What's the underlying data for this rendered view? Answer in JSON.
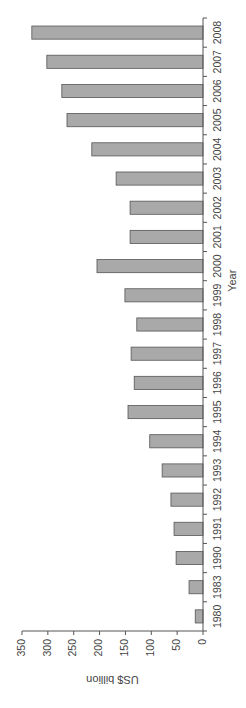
{
  "chart_data": {
    "type": "bar",
    "orientation": "rotated-90-clockwise",
    "title": "",
    "xlabel": "Year",
    "ylabel": "US$ billion",
    "ylim": [
      0,
      350
    ],
    "yticks": [
      0,
      50,
      100,
      150,
      200,
      250,
      300,
      350
    ],
    "grid": false,
    "legend": null,
    "categories": [
      "1980",
      "1983",
      "1990",
      "1991",
      "1992",
      "1993",
      "1994",
      "1995",
      "1996",
      "1997",
      "1998",
      "1999",
      "2000",
      "2001",
      "2002",
      "2003",
      "2004",
      "2005",
      "2006",
      "2007",
      "2008"
    ],
    "values": [
      15,
      27,
      52,
      56,
      62,
      79,
      103,
      145,
      133,
      139,
      128,
      151,
      205,
      141,
      141,
      168,
      215,
      263,
      273,
      302,
      331
    ],
    "bar_color": "#a9a9a9"
  }
}
